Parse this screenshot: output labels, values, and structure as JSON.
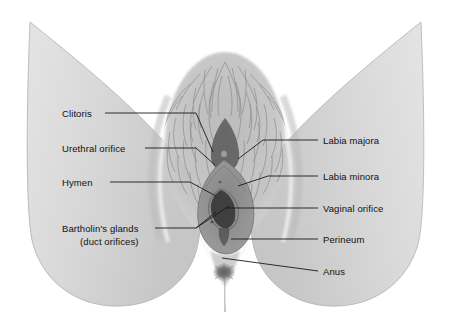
{
  "figure": {
    "background_color": "#ffffff",
    "ink_color": "#111111",
    "skin_color": "#d6d6d6",
    "skin_shadow_color": "#b8b8b8",
    "vestibule_color": "#8e8e8e",
    "labia_minora_color": "#9a9a9a",
    "dark_orifice_color": "#4c4c4c",
    "hair_color": "#8a8a8a"
  },
  "labels": {
    "left": [
      {
        "id": "clitoris",
        "text": "Clitoris",
        "x": 62,
        "y": 117
      },
      {
        "id": "urethral-orifice",
        "text": "Urethral orifice",
        "x": 62,
        "y": 152
      },
      {
        "id": "hymen",
        "text": "Hymen",
        "x": 62,
        "y": 186
      },
      {
        "id": "bartholins-glands",
        "text": "Bartholin's glands",
        "x": 62,
        "y": 232
      },
      {
        "id": "bartholins-glands-sub",
        "text": "(duct orifices)",
        "x": 80,
        "y": 245
      }
    ],
    "right": [
      {
        "id": "labia-majora",
        "text": "Labia majora",
        "x": 323,
        "y": 144
      },
      {
        "id": "labia-minora",
        "text": "Labia minora",
        "x": 323,
        "y": 180
      },
      {
        "id": "vaginal-orifice",
        "text": "Vaginal orifice",
        "x": 323,
        "y": 212
      },
      {
        "id": "perineum",
        "text": "Perineum",
        "x": 323,
        "y": 243
      },
      {
        "id": "anus",
        "text": "Anus",
        "x": 323,
        "y": 275
      }
    ]
  },
  "leader_lines": {
    "clitoris": "M 105 113 L 196 113 L 213 152",
    "urethral_orifice": "M 145 148 L 196 148 L 215 165",
    "hymen": "M 110 182 L 190 182 L 216 196",
    "bartholins_left": "M 155 228 L 196 228 L 229 206",
    "bartholins_right": "M 196 228 L 216 212",
    "labia_majora": "M 318 140 L 263 140 L 238 159",
    "labia_minora": "M 318 176 L 268 176 L 238 186",
    "vaginal_orifice": "M 318 208 L 226 208",
    "perineum": "M 318 239 L 231 239",
    "anus": "M 318 271 L 222 258"
  }
}
